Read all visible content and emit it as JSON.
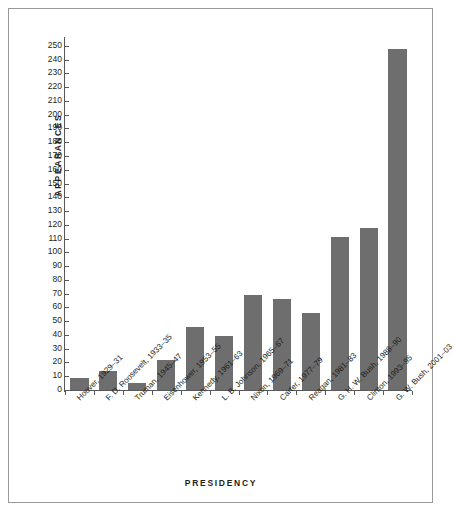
{
  "chart_data": {
    "type": "bar",
    "title": "",
    "xlabel": "PRESIDENCY",
    "ylabel": "APPEARANCES",
    "ylim": [
      0,
      255
    ],
    "ytick_step": 10,
    "grid": false,
    "legend": null,
    "bar_color": "#6e6e6e",
    "axis_color": "#58595b",
    "frame_color": "#9a9a9a",
    "background": "#ffffff",
    "yticks": [
      0,
      10,
      20,
      30,
      40,
      50,
      60,
      70,
      80,
      90,
      100,
      110,
      120,
      130,
      140,
      150,
      160,
      170,
      180,
      190,
      200,
      210,
      220,
      230,
      240,
      250
    ],
    "categories": [
      "Hoover, 1929–31",
      "F. D. Roosevelt, 1933–35",
      "Truman, 1945–47",
      "Eisenhower, 1953–55",
      "Kennedy, 1961–63",
      "L. B. Johnson, 1965–67",
      "Nixon, 1969–71",
      "Carter, 1977–79",
      "Reagan, 1981–83",
      "G. H. W. Bush, 1988–90",
      "Clinton, 1993–95",
      "G. W. Bush, 2001–03"
    ],
    "values": [
      9,
      14,
      5,
      22,
      46,
      39,
      69,
      66,
      56,
      111,
      118,
      248
    ]
  }
}
